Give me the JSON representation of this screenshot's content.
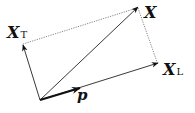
{
  "diagram": {
    "origin": {
      "x": 40,
      "y": 100
    },
    "vectors": [
      {
        "id": "X",
        "label": "X",
        "subscript": "",
        "tip": {
          "x": 138,
          "y": 7
        },
        "style": "thin"
      },
      {
        "id": "X_T",
        "label": "X",
        "subscript": "T",
        "tip": {
          "x": 23,
          "y": 45
        },
        "style": "thin"
      },
      {
        "id": "X_L",
        "label": "X",
        "subscript": "L",
        "tip": {
          "x": 158,
          "y": 63
        },
        "style": "thin"
      },
      {
        "id": "p",
        "label": "p",
        "subscript": "",
        "tip": {
          "x": 80,
          "y": 88
        },
        "style": "thick"
      }
    ],
    "projection_lines": [
      {
        "from": "X_T",
        "to": "X",
        "style": "dotted"
      },
      {
        "from": "X",
        "to": "X_L",
        "style": "dotted"
      }
    ],
    "labels": {
      "x": "X",
      "x_t_main": "X",
      "x_t_sub": "T",
      "x_l_main": "X",
      "x_l_sub": "L",
      "p": "p"
    },
    "colors": {
      "stroke": "#222222",
      "dotted": "#666666",
      "background": "#ffffff"
    }
  }
}
